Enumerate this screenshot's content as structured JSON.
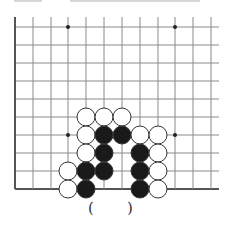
{
  "diagram": {
    "type": "go-board-fragment",
    "grid": {
      "columns_x": [
        15,
        33,
        51,
        68,
        86,
        104,
        122,
        140,
        158,
        175,
        193,
        211
      ],
      "rows_y": [
        27,
        45,
        63,
        81,
        99,
        117,
        135,
        153,
        171,
        189
      ],
      "line_color": "#8a8a8a",
      "edge_color": "#555555",
      "left_edge": true,
      "bottom_edge": true,
      "top_open": true,
      "right_open": true
    },
    "star_points": [
      {
        "col": 3,
        "row": 0
      },
      {
        "col": 9,
        "row": 0
      },
      {
        "col": 3,
        "row": 6
      },
      {
        "col": 9,
        "row": 6
      }
    ],
    "stones": [
      {
        "color": "white",
        "col": 4,
        "row": 5
      },
      {
        "color": "white",
        "col": 5,
        "row": 5
      },
      {
        "color": "white",
        "col": 6,
        "row": 5
      },
      {
        "color": "white",
        "col": 4,
        "row": 6
      },
      {
        "color": "black",
        "col": 5,
        "row": 6
      },
      {
        "color": "black",
        "col": 6,
        "row": 6
      },
      {
        "color": "white",
        "col": 7,
        "row": 6
      },
      {
        "color": "white",
        "col": 8,
        "row": 6
      },
      {
        "color": "white",
        "col": 4,
        "row": 7
      },
      {
        "color": "black",
        "col": 5,
        "row": 7
      },
      {
        "color": "black",
        "col": 7,
        "row": 7
      },
      {
        "color": "white",
        "col": 8,
        "row": 7
      },
      {
        "color": "white",
        "col": 3,
        "row": 8
      },
      {
        "color": "black",
        "col": 4,
        "row": 8
      },
      {
        "color": "black",
        "col": 5,
        "row": 8
      },
      {
        "color": "black",
        "col": 7,
        "row": 8
      },
      {
        "color": "white",
        "col": 8,
        "row": 8
      },
      {
        "color": "white",
        "col": 3,
        "row": 9
      },
      {
        "color": "black",
        "col": 4,
        "row": 9
      },
      {
        "color": "black",
        "col": 7,
        "row": 9
      },
      {
        "color": "white",
        "col": 8,
        "row": 9
      }
    ],
    "stone_radius": 9,
    "colors": {
      "black_stone": "#1a1a1a",
      "white_stone": "#ffffff",
      "stone_outline": "#333333"
    }
  },
  "answer_blank": {
    "open_paren": "(",
    "close_paren": ")"
  }
}
